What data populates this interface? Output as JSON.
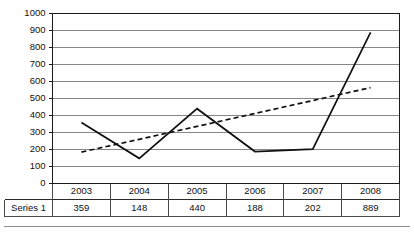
{
  "chart_data": {
    "type": "line",
    "title": "",
    "subtitle": "",
    "xlabel": "",
    "ylabel": "",
    "categories": [
      "2003",
      "2004",
      "2005",
      "2006",
      "2007",
      "2008"
    ],
    "series": [
      {
        "name": "Series 1",
        "style": "solid",
        "values": [
          359,
          148,
          440,
          188,
          202,
          889
        ]
      },
      {
        "name": "Linear trendline",
        "style": "dashed",
        "values": [
          185,
          260,
          336,
          412,
          488,
          564
        ]
      }
    ],
    "ylim": [
      0,
      1000
    ],
    "ytick_step": 100,
    "yticks": [
      "0",
      "100",
      "200",
      "300",
      "400",
      "500",
      "600",
      "700",
      "800",
      "900",
      "1000"
    ],
    "grid": "horizontal",
    "legend": "none",
    "data_table": {
      "visible": true,
      "row_header": "Series 1",
      "columns": [
        "2003",
        "2004",
        "2005",
        "2006",
        "2007",
        "2008"
      ],
      "values": [
        "359",
        "148",
        "440",
        "188",
        "202",
        "889"
      ]
    },
    "colors": {
      "series_line": "#111111",
      "trend_line": "#111111",
      "gridline": "#878787",
      "axis": "#1a1a1a",
      "background": "#ffffff",
      "table_border": "#4a4a4a"
    }
  }
}
